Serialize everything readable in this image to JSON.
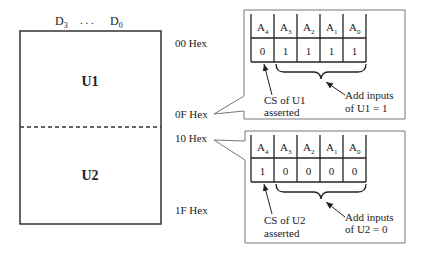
{
  "memory_map": {
    "data_bus_label_left": "D",
    "data_bus_left_sub": "3",
    "data_bus_ellipsis": ". . .",
    "data_bus_label_right": "D",
    "data_bus_right_sub": "0",
    "chips": [
      {
        "label": "U1",
        "start": "00 Hex",
        "end": "0F Hex"
      },
      {
        "label": "U2",
        "start": "10 Hex",
        "end": "1F Hex"
      }
    ]
  },
  "callouts": [
    {
      "headers": [
        {
          "base": "A",
          "sub": "4"
        },
        {
          "base": "A",
          "sub": "3"
        },
        {
          "base": "A",
          "sub": "2"
        },
        {
          "base": "A",
          "sub": "1"
        },
        {
          "base": "A",
          "sub": "0"
        }
      ],
      "bits": [
        "0",
        "1",
        "1",
        "1",
        "1"
      ],
      "cs_label_line1": "CS of U1",
      "cs_label_line2": "asserted",
      "add_label_line1": "Add inputs",
      "add_label_line2": "of U1 = 1"
    },
    {
      "headers": [
        {
          "base": "A",
          "sub": "4"
        },
        {
          "base": "A",
          "sub": "3"
        },
        {
          "base": "A",
          "sub": "2"
        },
        {
          "base": "A",
          "sub": "1"
        },
        {
          "base": "A",
          "sub": "0"
        }
      ],
      "bits": [
        "1",
        "0",
        "0",
        "0",
        "0"
      ],
      "cs_label_line1": "CS of U2",
      "cs_label_line2": "asserted",
      "add_label_line1": "Add inputs",
      "add_label_line2": "of U2 = 0"
    }
  ]
}
